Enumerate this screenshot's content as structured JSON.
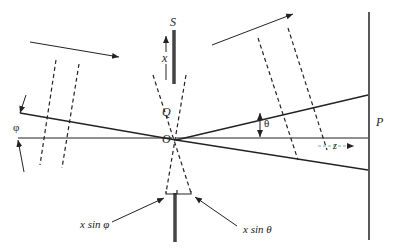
{
  "diagram": {
    "type": "single-slit diffraction geometry",
    "labels": {
      "source": "S",
      "axis_x": "x",
      "point_q": "Q",
      "origin": "O",
      "angle_theta": "θ",
      "angle_phi": "φ",
      "axis_z": "z",
      "screen": "P",
      "path_diff_phi": "x sin φ",
      "path_diff_theta": "x sin θ"
    },
    "colors": {
      "line": "#222222",
      "slit": "#444444",
      "background": "#ffffff"
    }
  }
}
